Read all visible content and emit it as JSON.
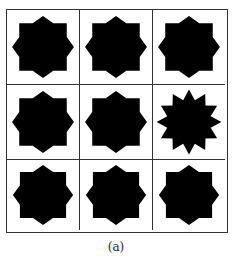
{
  "figure": {
    "caption": "(a)",
    "grid": {
      "rows": 3,
      "cols": 3
    },
    "cells": [
      {
        "row": 1,
        "col": 1,
        "shape": "8-point-star"
      },
      {
        "row": 1,
        "col": 2,
        "shape": "8-point-star"
      },
      {
        "row": 1,
        "col": 3,
        "shape": "8-point-star"
      },
      {
        "row": 2,
        "col": 1,
        "shape": "8-point-star"
      },
      {
        "row": 2,
        "col": 2,
        "shape": "8-point-star"
      },
      {
        "row": 2,
        "col": 3,
        "shape": "12-point-star"
      },
      {
        "row": 3,
        "col": 1,
        "shape": "8-point-star"
      },
      {
        "row": 3,
        "col": 2,
        "shape": "8-point-star"
      },
      {
        "row": 3,
        "col": 3,
        "shape": "8-point-star"
      }
    ],
    "colors": {
      "fill": "#000000",
      "line": "#333333",
      "background": "#ffffff"
    }
  }
}
